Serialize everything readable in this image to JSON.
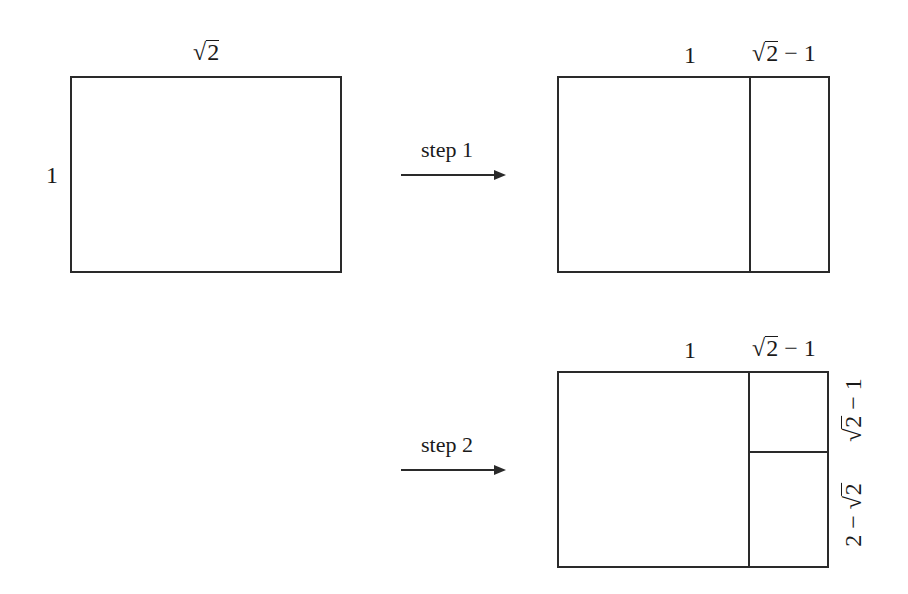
{
  "diagram": {
    "panels": [
      {
        "id": "initial",
        "top_label": {
          "radical": "√",
          "radicand": "2",
          "suffix": ""
        },
        "left_label": "1"
      },
      {
        "id": "after-step-1",
        "arrow_label": "step 1",
        "top_labels": [
          {
            "text": "1"
          },
          {
            "radical": "√",
            "radicand": "2",
            "suffix": " − 1"
          }
        ]
      },
      {
        "id": "after-step-2",
        "arrow_label": "step 2",
        "top_labels": [
          {
            "text": "1"
          },
          {
            "radical": "√",
            "radicand": "2",
            "suffix": " − 1"
          }
        ],
        "right_labels": [
          {
            "radical": "√",
            "radicand": "2",
            "suffix": " − 1",
            "prefix": ""
          },
          {
            "prefix": "2 − ",
            "radical": "√",
            "radicand": "2",
            "suffix": ""
          }
        ]
      }
    ],
    "colors": {
      "line": "#2a2a2a",
      "text": "#1a1a1a",
      "background": "#ffffff"
    }
  }
}
